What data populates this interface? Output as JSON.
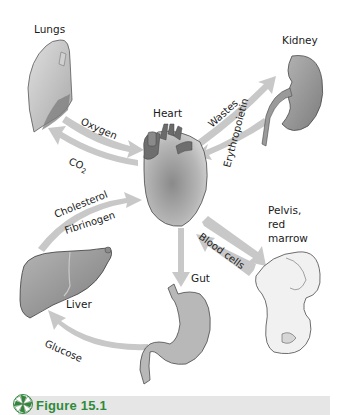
{
  "organs": {
    "lungs": "Lungs",
    "heart": "Heart",
    "kidney": "Kidney",
    "liver": "Liver",
    "gut": "Gut",
    "pelvis_line1": "Pelvis,",
    "pelvis_line2": "red",
    "pelvis_line3": "marrow"
  },
  "arrows": {
    "oxygen": "Oxygen",
    "co2_main": "CO",
    "co2_sub": "2",
    "wastes": "Wastes",
    "erythropoietin": "Erythropoietin",
    "cholesterol": "Cholesterol",
    "fibrinogen": "Fibrinogen",
    "blood_cells": "Blood cells",
    "glucose": "Glucose"
  },
  "footer": {
    "figure_label": "Figure 15.1"
  },
  "colors": {
    "arrow": "#c8c8c8",
    "organ_dark": "#7a7a7a",
    "organ_mid": "#9c9c9c",
    "figure_green": "#2f8a3a",
    "footer_bg": "#e6e6e6"
  }
}
